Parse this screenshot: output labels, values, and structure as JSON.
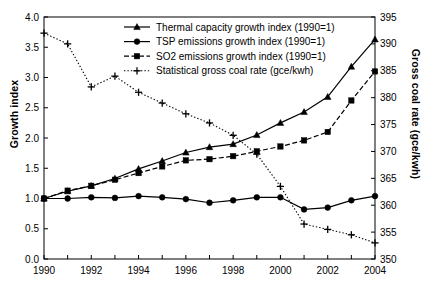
{
  "chart_data": {
    "type": "line",
    "title": "",
    "xlabel": "",
    "ylabel": "Growth index",
    "y2label": "Gross coal rate (gce/kwh)",
    "x": [
      1990,
      1991,
      1992,
      1993,
      1994,
      1995,
      1996,
      1997,
      1998,
      1999,
      2000,
      2001,
      2002,
      2003,
      2004
    ],
    "xtick_labels": [
      "1990",
      "1992",
      "1994",
      "1996",
      "1998",
      "2000",
      "2002",
      "2004"
    ],
    "xticks": [
      1990,
      1992,
      1994,
      1996,
      1998,
      2000,
      2002,
      2004
    ],
    "xlim": [
      1990,
      2004
    ],
    "ylim": [
      0.0,
      4.0
    ],
    "yticks": [
      0.0,
      0.5,
      1.0,
      1.5,
      2.0,
      2.5,
      3.0,
      3.5,
      4.0
    ],
    "ytick_labels": [
      "0.0",
      "0.5",
      "1.0",
      "1.5",
      "2.0",
      "2.5",
      "3.0",
      "3.5",
      "4.0"
    ],
    "y2lim": [
      350,
      395
    ],
    "y2ticks": [
      350,
      355,
      360,
      365,
      370,
      375,
      380,
      385,
      390,
      395
    ],
    "y2tick_labels": [
      "350",
      "355",
      "360",
      "365",
      "370",
      "375",
      "380",
      "385",
      "390",
      "395"
    ],
    "grid": false,
    "legend_position": "upper center",
    "series": [
      {
        "name": "Thermal capacity growth index (1990=1)",
        "axis": "left",
        "marker": "triangle",
        "line_style": "solid",
        "color": "#000000",
        "values": [
          1.0,
          1.12,
          1.21,
          1.33,
          1.49,
          1.62,
          1.76,
          1.85,
          1.9,
          2.05,
          2.25,
          2.43,
          2.68,
          3.18,
          3.63
        ]
      },
      {
        "name": "TSP emissions growth index (1990=1)",
        "axis": "left",
        "marker": "circle",
        "line_style": "solid",
        "color": "#000000",
        "values": [
          1.0,
          1.0,
          1.02,
          1.01,
          1.04,
          1.02,
          0.99,
          0.93,
          0.97,
          1.02,
          1.02,
          0.82,
          0.85,
          0.97,
          1.04
        ]
      },
      {
        "name": "SO2 emissions growth index (1990=1)",
        "axis": "left",
        "marker": "square",
        "line_style": "dashed",
        "color": "#000000",
        "values": [
          1.0,
          1.13,
          1.21,
          1.31,
          1.42,
          1.53,
          1.63,
          1.65,
          1.7,
          1.78,
          1.86,
          1.96,
          2.1,
          2.62,
          3.1
        ]
      },
      {
        "name": "Statistical gross coal rate (gce/kwh)",
        "axis": "right",
        "marker": "plus",
        "line_style": "dotted",
        "color": "#000000",
        "values": [
          392.0,
          390.0,
          382.0,
          384.0,
          381.0,
          379.0,
          377.0,
          375.3,
          373.0,
          369.5,
          363.5,
          356.5,
          355.5,
          354.5,
          353.0
        ]
      }
    ]
  }
}
